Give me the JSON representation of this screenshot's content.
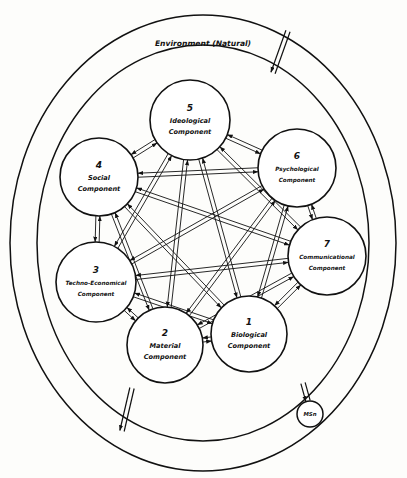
{
  "figure": {
    "title_label": "Environment (Natural)",
    "background_color": "#fdfdfb",
    "stroke_color": "#111111",
    "width": 407,
    "height": 478
  },
  "chart_data": {
    "type": "diagram",
    "title": "Environment (Natural)",
    "outer_ring": {
      "label": "Environment (Natural)",
      "cx": 203,
      "cy": 243,
      "rx": 193,
      "ry": 228
    },
    "inner_ring": {
      "cx": 203,
      "cy": 243,
      "rx": 166,
      "ry": 198
    },
    "nodes": [
      {
        "id": 1,
        "number": "1",
        "name": "Biological Component",
        "line1": "Biological",
        "line2": "Component",
        "cx": 249,
        "cy": 334,
        "r": 38
      },
      {
        "id": 2,
        "number": "2",
        "name": "Material Component",
        "line1": "Material",
        "line2": "Component",
        "cx": 165,
        "cy": 345,
        "r": 38
      },
      {
        "id": 3,
        "number": "3",
        "name": "Techno-Economical Component",
        "line1": "Techno-Economical",
        "line2": "Component",
        "cx": 96,
        "cy": 282,
        "r": 40
      },
      {
        "id": 4,
        "number": "4",
        "name": "Social Component",
        "line1": "Social",
        "line2": "Component",
        "cx": 99,
        "cy": 177,
        "r": 39
      },
      {
        "id": 5,
        "number": "5",
        "name": "Ideological Component",
        "line1": "Ideological",
        "line2": "Component",
        "cx": 190,
        "cy": 120,
        "r": 40
      },
      {
        "id": 6,
        "number": "6",
        "name": "Psychological Component",
        "line1": "Psychological",
        "line2": "Component",
        "cx": 297,
        "cy": 168,
        "r": 39
      },
      {
        "id": 7,
        "number": "7",
        "name": "Communicational Component",
        "line1": "Communicational",
        "line2": "Component",
        "cx": 327,
        "cy": 256,
        "r": 39
      }
    ],
    "mini_node": {
      "label": "MSn",
      "cx": 310,
      "cy": 414,
      "r": 13
    },
    "external_links": [
      {
        "name": "environment-link-top-right",
        "x1": 288,
        "y1": 31,
        "x2": 273,
        "y2": 73,
        "direction": "inward"
      },
      {
        "name": "environment-link-bottom-left",
        "x1": 132,
        "y1": 388,
        "x2": 122,
        "y2": 431,
        "direction": "inward"
      },
      {
        "name": "mini-node-link",
        "x1": 303,
        "y1": 383,
        "x2": 308,
        "y2": 401,
        "direction": "inward"
      }
    ],
    "edges": {
      "style": "double-line bidirectional arrows",
      "connectivity": "complete graph (every node connected to every other node)",
      "pairs": [
        [
          1,
          2
        ],
        [
          1,
          3
        ],
        [
          1,
          4
        ],
        [
          1,
          5
        ],
        [
          1,
          6
        ],
        [
          1,
          7
        ],
        [
          2,
          3
        ],
        [
          2,
          4
        ],
        [
          2,
          5
        ],
        [
          2,
          6
        ],
        [
          2,
          7
        ],
        [
          3,
          4
        ],
        [
          3,
          5
        ],
        [
          3,
          6
        ],
        [
          3,
          7
        ],
        [
          4,
          5
        ],
        [
          4,
          6
        ],
        [
          4,
          7
        ],
        [
          5,
          6
        ],
        [
          5,
          7
        ],
        [
          6,
          7
        ]
      ]
    }
  }
}
